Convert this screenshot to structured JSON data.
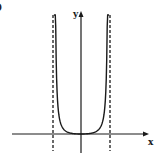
{
  "figure": {
    "panel_label": ")",
    "colors": {
      "ink": "#1a1a1a",
      "background": "#ffffff"
    }
  },
  "chart_data": {
    "type": "line",
    "title": "",
    "xlabel": "x",
    "ylabel": "y",
    "grid": false,
    "legend": null,
    "axis_ticks": "none",
    "series": [
      {
        "name": "curve",
        "description": "U-shaped curve with minimum at origin, rising to infinity at two vertical asymptotes",
        "x": [
          -0.98,
          -0.9,
          -0.75,
          -0.5,
          -0.25,
          0,
          0.25,
          0.5,
          0.75,
          0.9,
          0.98
        ],
        "y": [
          9.5,
          4.2,
          1.8,
          0.55,
          0.12,
          0,
          0.12,
          0.55,
          1.8,
          4.2,
          9.5
        ]
      }
    ],
    "asymptotes": [
      {
        "orientation": "vertical",
        "x": -1,
        "style": "dashed"
      },
      {
        "orientation": "vertical",
        "x": 1,
        "style": "dashed"
      }
    ],
    "annotations": [
      "x",
      "y"
    ]
  }
}
